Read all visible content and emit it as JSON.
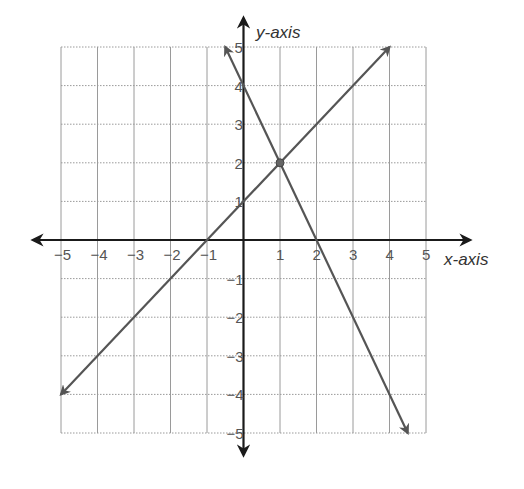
{
  "chart_data": {
    "type": "line",
    "title": "",
    "xlabel": "x-axis",
    "ylabel": "y-axis",
    "xlim": [
      -5,
      5
    ],
    "ylim": [
      -5,
      5
    ],
    "grid": true,
    "x_ticks": [
      "-5",
      "-4",
      "-3",
      "-2",
      "-1",
      "1",
      "2",
      "3",
      "4",
      "5"
    ],
    "y_ticks": [
      "5",
      "4",
      "3",
      "2",
      "1",
      "-1",
      "-2",
      "-3",
      "-4",
      "-5"
    ],
    "series": [
      {
        "name": "y = x + 1",
        "points": [
          [
            -5,
            -4
          ],
          [
            -1,
            0
          ],
          [
            0,
            1
          ],
          [
            1,
            2
          ],
          [
            4,
            5
          ]
        ],
        "arrows": "both"
      },
      {
        "name": "y = -2x + 4",
        "points": [
          [
            -0.5,
            5
          ],
          [
            0,
            4
          ],
          [
            1,
            2
          ],
          [
            2,
            0
          ],
          [
            4.5,
            -5
          ]
        ],
        "arrows": "both"
      }
    ],
    "annotations": [
      {
        "type": "point",
        "x": 1,
        "y": 2,
        "label": "intersection"
      }
    ]
  },
  "labels": {
    "x_axis": "x-axis",
    "y_axis": "y-axis"
  },
  "colors": {
    "axis": "#1a1a1a",
    "line": "#555555",
    "grid": "#9a9a9a"
  }
}
